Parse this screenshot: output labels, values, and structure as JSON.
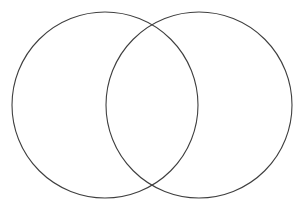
{
  "page": {
    "background_color": "#ffffff",
    "width": 304,
    "height": 208
  },
  "chart_data": {
    "type": "diagram",
    "subtype": "venn",
    "title": "",
    "subtitle": "",
    "xlabel": "",
    "ylabel": "",
    "legend": [],
    "annotations": [],
    "grid": false,
    "stroke_color": "#3f3f3f",
    "stroke_width": 1.1,
    "fill": "none",
    "background": "#ffffff",
    "view_box": "0 0 304 208",
    "set_count": 2,
    "sets": [
      {
        "name": "left-set",
        "label": "",
        "shape": "circle",
        "cx": 105,
        "cy": 105,
        "r": 93,
        "fill": "none",
        "stroke": "#3f3f3f"
      },
      {
        "name": "right-set",
        "label": "",
        "shape": "circle",
        "cx": 199,
        "cy": 105,
        "r": 93,
        "fill": "none",
        "stroke": "#3f3f3f"
      }
    ],
    "regions": [
      {
        "name": "left-only",
        "label": "",
        "value": null
      },
      {
        "name": "intersection",
        "label": "",
        "value": null
      },
      {
        "name": "right-only",
        "label": "",
        "value": null
      }
    ],
    "intersection_points": [
      {
        "x": 152,
        "y": 23
      },
      {
        "x": 152,
        "y": 187
      }
    ]
  }
}
